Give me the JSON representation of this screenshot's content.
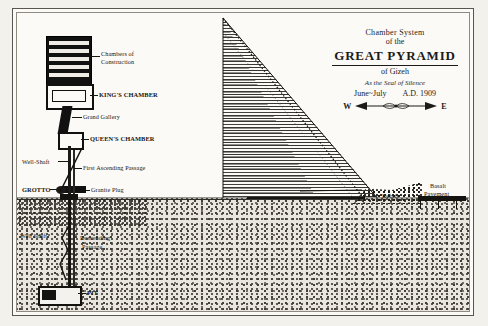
{
  "plate": {
    "title_block": {
      "line1": "Chamber System",
      "line2": "of the",
      "main": "GREAT  PYRAMID",
      "sub": "of Gizeh",
      "script": "As the Seal of Silence",
      "date_left": "June~July",
      "date_right": "A.D. 1909",
      "compass_west": "W",
      "compass_east": "E"
    },
    "labels": [
      {
        "id": "chambers-of-construction",
        "text": "Chambers of",
        "text2": "Construction"
      },
      {
        "id": "kings-chamber",
        "text": "KING'S CHAMBER"
      },
      {
        "id": "grand-gallery",
        "text": "Grand Gallery"
      },
      {
        "id": "queens-chamber",
        "text": "QUEEN'S CHAMBER"
      },
      {
        "id": "well-shaft-upper",
        "text": "Well-Shaft"
      },
      {
        "id": "first-ascending-passage",
        "text": "First Ascending Passage"
      },
      {
        "id": "grotto",
        "text": "GROTTO"
      },
      {
        "id": "granite-plug",
        "text": "Granite Plug"
      },
      {
        "id": "well-shaft-lower",
        "text": "Well Shaft"
      },
      {
        "id": "descending-passage",
        "text": "Descending"
      },
      {
        "id": "descending-passage-2",
        "text": "Passage"
      },
      {
        "id": "pit",
        "text": "PIT"
      },
      {
        "id": "debris",
        "text": "Debris"
      },
      {
        "id": "basalt-pavement",
        "text": "Basalt"
      },
      {
        "id": "basalt-pavement-2",
        "text": "Pavement"
      }
    ]
  }
}
